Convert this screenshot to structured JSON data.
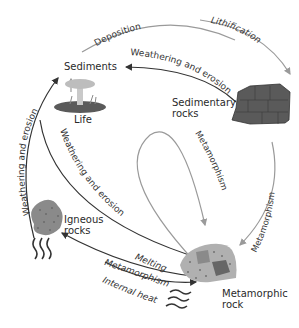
{
  "colors": {
    "dark_arrow": "#333333",
    "gray_arrow": "#9a9a9a",
    "rock_dark": "#555555",
    "rock_light": "#b8b8b8"
  },
  "nodes": {
    "sediments": "Sediments",
    "life": "Life",
    "sedimentary_1": "Sedimentary",
    "sedimentary_2": "rocks",
    "igneous_1": "Igneous",
    "igneous_2": "rocks",
    "metamorphic_1": "Metamorphic",
    "metamorphic_2": "rock"
  },
  "processes": {
    "deposition": "Deposition",
    "lithification": "Lithification",
    "weathering_sed": "Weathering and erosion",
    "weathering_ign": "Weathering and erosion",
    "weathering_met": "Weathering and erosion",
    "metamorphism_loop": "Metamorphism",
    "metamorphism_sed": "Metamorphism",
    "melting": "Melting",
    "metamorphism_bottom": "Metamorphism",
    "internal_heat": "Internal heat"
  }
}
